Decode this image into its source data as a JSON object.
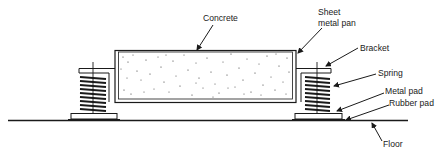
{
  "diagram": {
    "colors": {
      "ink": "#1a1a1a",
      "background": "#ffffff"
    },
    "labels": {
      "concrete": "Concrete",
      "sheet_metal_pan_line1": "Sheet",
      "sheet_metal_pan_line2": "metal pan",
      "bracket": "Bracket",
      "spring": "Spring",
      "metal_pad": "Metal pad",
      "rubber_pad": "Rubber pad",
      "floor": "Floor"
    },
    "components": [
      "concrete-slab",
      "sheet-metal-pan",
      "bracket-left",
      "bracket-right",
      "spring-left",
      "spring-right",
      "metal-pad-left",
      "metal-pad-right",
      "rubber-pad-left",
      "rubber-pad-right",
      "floor-line"
    ]
  }
}
